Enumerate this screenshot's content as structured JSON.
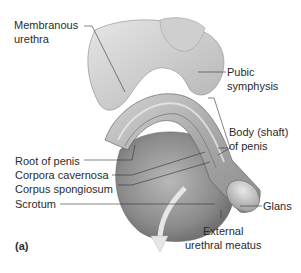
{
  "figure": {
    "panel_label": "(a)",
    "labels": {
      "membranous_urethra_1": "Membranous",
      "membranous_urethra_2": "urethra",
      "pubic_symphysis_1": "Pubic",
      "pubic_symphysis_2": "symphysis",
      "body_shaft_1": "Body (shaft)",
      "body_shaft_2": "of penis",
      "root_of_penis": "Root of penis",
      "corpora_cavernosa": "Corpora cavernosa",
      "corpus_spongiosum": "Corpus spongiosum",
      "scrotum": "Scrotum",
      "glans": "Glans",
      "external_meatus_1": "External",
      "external_meatus_2": "urethral meatus"
    }
  }
}
